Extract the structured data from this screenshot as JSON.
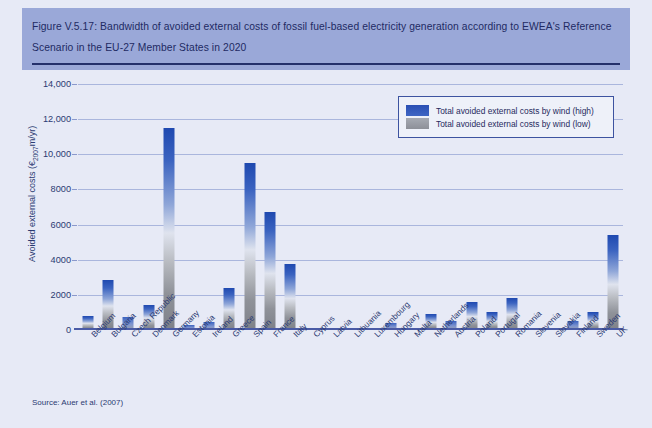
{
  "figure": {
    "title": "Figure V.5.17: Bandwidth of avoided external costs of fossil fuel-based electricity generation according to EWEA's Reference Scenario in the EU-27 Member States in 2020",
    "source": "Source: Auer et al. (2007)",
    "colors": {
      "header_band": "#9aa8d8",
      "body_background": "#e7eaf6",
      "rule": "#24306b",
      "text": "#2b3a72",
      "grid": "#aab6dd",
      "series_high": "#2a4fb3",
      "series_low": "#8d9098"
    }
  },
  "legend": {
    "position": "top-right",
    "entries": [
      {
        "label": "Total avoided external costs by wind (high)",
        "swatch": "sw-high"
      },
      {
        "label": "Total avoided external costs by wind (low)",
        "swatch": "sw-low"
      }
    ]
  },
  "chart_data": {
    "type": "bar",
    "title": "Bandwidth of avoided external costs of fossil fuel-based electricity generation according to EWEA's Reference Scenario in the EU-27 Member States in 2020",
    "xlabel": "",
    "ylabel": "Avoided external costs (€2007m/yr)",
    "ylabel_prefix": "Avoided external costs (€",
    "ylabel_sub": "2007",
    "ylabel_suffix": "m/yr)",
    "ylim": [
      0,
      14000
    ],
    "ytick_values": [
      0,
      2000,
      4000,
      6000,
      8000,
      10000,
      12000,
      14000
    ],
    "ytick_labels": [
      "0",
      "2000",
      "4000",
      "6000",
      "8000",
      "10,000",
      "12,000",
      "14,000"
    ],
    "grid": true,
    "categories": [
      "Belgium",
      "Bulgaria",
      "Czech Republic",
      "Denmark",
      "Germany",
      "Estonia",
      "Ireland",
      "Greece",
      "Spain",
      "France",
      "Italy",
      "Cyprus",
      "Latvia",
      "Lithuania",
      "Luxembourg",
      "Hungary",
      "Malta",
      "Netherlands",
      "Austria",
      "Poland",
      "Portugal",
      "Romania",
      "Slovenia",
      "Slovakia",
      "Finland",
      "Sweden",
      "UK"
    ],
    "series": [
      {
        "name": "Total avoided external costs by wind (high)",
        "values": [
          800,
          2850,
          750,
          1400,
          11500,
          300,
          450,
          2400,
          9500,
          6700,
          3750,
          60,
          50,
          60,
          40,
          380,
          30,
          900,
          500,
          1600,
          1000,
          1850,
          120,
          70,
          500,
          1000,
          5400
        ]
      },
      {
        "name": "Total avoided external costs by wind (low)",
        "values": [
          300,
          1100,
          280,
          520,
          4300,
          110,
          170,
          900,
          3600,
          2550,
          1400,
          20,
          18,
          22,
          14,
          140,
          10,
          340,
          190,
          600,
          380,
          700,
          45,
          26,
          190,
          380,
          2050
        ]
      }
    ]
  }
}
